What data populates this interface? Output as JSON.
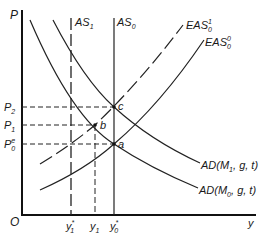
{
  "diagram": {
    "axes": {
      "y_label": "P",
      "x_label": "y",
      "origin_label": "O"
    },
    "curves": {
      "as1": {
        "base": "AS",
        "sub": "1",
        "style": "dashed"
      },
      "as0": {
        "base": "AS",
        "sub": "0",
        "style": "solid"
      },
      "eas01": {
        "base": "EAS",
        "sup": "1",
        "sub": "0",
        "style": "dashed"
      },
      "eas00": {
        "base": "EAS",
        "sup": "0",
        "sub": "0",
        "style": "solid"
      },
      "ad1": {
        "prefix": "AD(M",
        "sub": "1",
        "suffix": ", g, t)"
      },
      "ad0": {
        "prefix": "AD(M",
        "sub": "0",
        "suffix": ", g, t)"
      }
    },
    "price_levels": [
      {
        "id": "p2",
        "base": "P",
        "sub": "2"
      },
      {
        "id": "p1",
        "base": "P",
        "sub": "1"
      },
      {
        "id": "p0e",
        "base": "P",
        "sup": "e",
        "sub": "0"
      }
    ],
    "output_levels": [
      {
        "id": "y1star",
        "base": "y",
        "sup": "*",
        "sub": "1"
      },
      {
        "id": "y1",
        "base": "y",
        "sub": "1"
      },
      {
        "id": "y0star",
        "base": "y",
        "sup": "*",
        "sub": "0"
      }
    ],
    "points": {
      "a": "a",
      "b": "b",
      "c": "c"
    }
  }
}
